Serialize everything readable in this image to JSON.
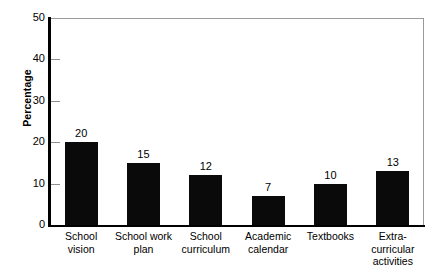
{
  "chart_data": {
    "type": "bar",
    "title": "",
    "subtitle": "",
    "xlabel": "",
    "ylabel": "Percentage",
    "ylim": [
      0,
      50
    ],
    "yticks": [
      0,
      10,
      20,
      30,
      40,
      50
    ],
    "ytick_labels": [
      "0",
      "10",
      "20",
      "30",
      "40",
      "50"
    ],
    "grid": false,
    "legend": null,
    "bar_color": "#0a0a0a",
    "background_color": "#ffffff",
    "frame_color": "#9a9a9a",
    "axis_color": "#000000",
    "show_value_labels": true,
    "categories": [
      "School vision",
      "School work plan",
      "School curriculum",
      "Academic calendar",
      "Textbooks",
      "Extra-curricular activities"
    ],
    "category_label_lines": [
      [
        "School",
        "vision"
      ],
      [
        "School work",
        "plan"
      ],
      [
        "School",
        "curriculum"
      ],
      [
        "Academic",
        "calendar"
      ],
      [
        "Textbooks"
      ],
      [
        "Extra-",
        "curricular",
        "activities"
      ]
    ],
    "values": [
      20,
      15,
      12,
      7,
      10,
      13
    ],
    "value_labels": [
      "20",
      "15",
      "12",
      "7",
      "10",
      "13"
    ]
  }
}
